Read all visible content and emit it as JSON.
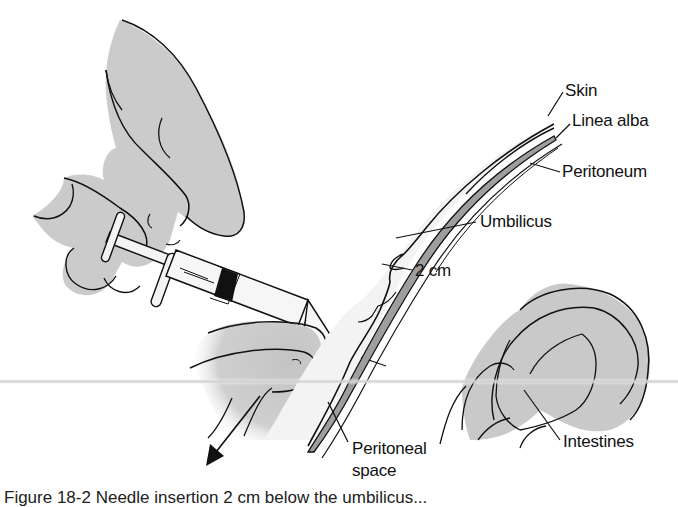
{
  "figure": {
    "colors": {
      "tissue_fill": "#c9c9c9",
      "skin_fill": "#f2f2f2",
      "line": "#111111",
      "background": "#ffffff",
      "shadow_band": "#d8d8d8"
    },
    "labels": {
      "skin": "Skin",
      "linea_alba": "Linea alba",
      "peritoneum": "Peritoneum",
      "umbilicus": "Umbilicus",
      "distance": "2 cm",
      "intestines": "Intestines",
      "peritoneal_space_line1": "Peritoneal",
      "peritoneal_space_line2": "space"
    },
    "caption": "Figure 18-2   Needle insertion 2 cm below the umbilicus..."
  }
}
